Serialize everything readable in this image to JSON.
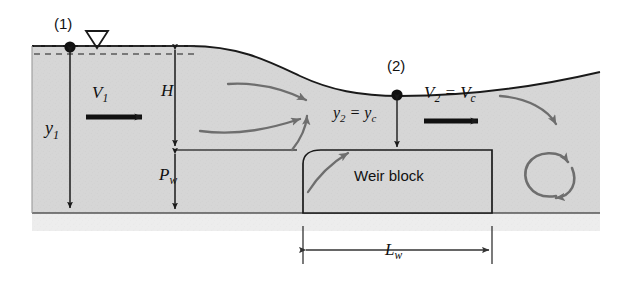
{
  "figure": {
    "labels": {
      "station_1": "(1)",
      "station_2": "(2)",
      "depth_upstream": "y",
      "depth_upstream_sub": "1",
      "velocity_upstream": "V",
      "velocity_upstream_sub": "1",
      "head": "H",
      "weir_height": "P",
      "weir_height_sub": "w",
      "depth_critical_lead": "y",
      "depth_critical_lead_sub": "2",
      "depth_critical_eq": " = ",
      "depth_critical_tail": "y",
      "depth_critical_tail_sub": "c",
      "velocity_critical_lead": "V",
      "velocity_critical_lead_sub": "2",
      "velocity_critical_eq": " = ",
      "velocity_critical_tail": "V",
      "velocity_critical_tail_sub": "c",
      "weir_block": "Weir block",
      "weir_length": "L",
      "weir_length_sub": "w"
    },
    "colors": {
      "water_fill": "#d6d6d6",
      "bed_fill": "#ededed",
      "outline": "#1a1a1a",
      "streamline": "#6e6e6e",
      "text": "#111111",
      "dashed_surface": "#333333"
    },
    "icons": {
      "free_surface": "free-surface-triangle-icon",
      "station_marker": "station-dot-icon",
      "flow_arrow": "flow-arrow-icon",
      "eddy": "recirculation-eddy-icon"
    }
  }
}
